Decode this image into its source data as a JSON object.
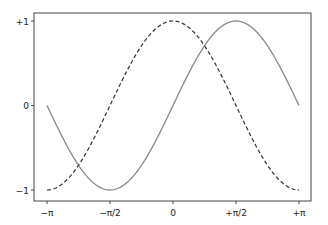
{
  "chart_data": {
    "type": "line",
    "title": "",
    "xlabel": "",
    "ylabel": "",
    "xlim": [
      -3.3,
      3.3
    ],
    "ylim": [
      -1.1,
      1.1
    ],
    "grid": false,
    "legend": null,
    "x_ticks": [
      {
        "value": -3.14159,
        "label": "−π"
      },
      {
        "value": -1.5708,
        "label": "−π/2"
      },
      {
        "value": 0,
        "label": "0"
      },
      {
        "value": 1.5708,
        "label": "+π/2"
      },
      {
        "value": 3.14159,
        "label": "+π"
      }
    ],
    "y_ticks": [
      {
        "value": 1,
        "label": "+1"
      },
      {
        "value": 0,
        "label": "0"
      },
      {
        "value": -1,
        "label": "−1"
      }
    ],
    "series": [
      {
        "name": "sin(x)",
        "function": "sin",
        "style": "solid",
        "color": "#888888",
        "x": [
          -3.14159,
          -1.5708,
          0,
          1.5708,
          3.14159
        ],
        "values": [
          0,
          -1,
          0,
          1,
          0
        ]
      },
      {
        "name": "cos(x)",
        "function": "cos",
        "style": "dashed",
        "color": "#333333",
        "x": [
          -3.14159,
          -1.5708,
          0,
          1.5708,
          3.14159
        ],
        "values": [
          -1,
          0,
          1,
          0,
          -1
        ]
      }
    ]
  }
}
